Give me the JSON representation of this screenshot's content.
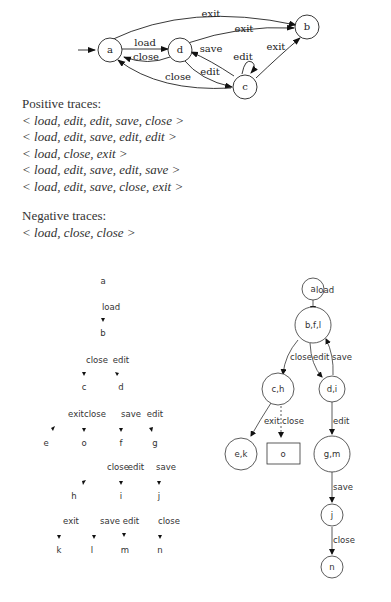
{
  "top_fsm": {
    "states": [
      "a",
      "d",
      "c",
      "b"
    ],
    "initial": "a",
    "edges": [
      {
        "from": "a",
        "to": "d",
        "label": "load"
      },
      {
        "from": "d",
        "to": "a",
        "label": "close"
      },
      {
        "from": "a",
        "to": "b",
        "label": "exit"
      },
      {
        "from": "d",
        "to": "b",
        "label": "exit"
      },
      {
        "from": "d",
        "to": "c",
        "label": "edit"
      },
      {
        "from": "c",
        "to": "d",
        "label": "save"
      },
      {
        "from": "c",
        "to": "c",
        "label": "edit"
      },
      {
        "from": "c",
        "to": "a",
        "label": "close"
      },
      {
        "from": "c",
        "to": "b",
        "label": "exit"
      }
    ]
  },
  "positive": {
    "title": "Positive traces:",
    "traces": [
      "< load, edit, edit, save, close >",
      "< load, edit, save, edit, edit >",
      "< load, close, exit >",
      "< load, edit, save, edit, save >",
      "< load, edit, save, close, exit >"
    ]
  },
  "negative": {
    "title": "Negative traces:",
    "traces": [
      "< load, close, close >"
    ]
  },
  "prefix_tree": {
    "nodes": [
      "a",
      "b",
      "c",
      "d",
      "e",
      "o",
      "f",
      "g",
      "h",
      "i",
      "j",
      "k",
      "l",
      "m",
      "n"
    ],
    "edge_labels": {
      "ab": "load",
      "bc": "close",
      "bd": "edit",
      "ce": "exit",
      "co": "close",
      "df": "save",
      "dg": "edit",
      "fh": "close",
      "fi": "edit",
      "gj": "save",
      "hk": "exit",
      "il": "save",
      "im": "edit",
      "jn": "close"
    }
  },
  "merged_fsm": {
    "nodes": {
      "a": "a",
      "bfl": "b,f,l",
      "ch": "c,h",
      "di": "d,i",
      "ek": "e,k",
      "o": "o",
      "gm": "g,m",
      "j": "j",
      "n": "n"
    },
    "edge_labels": {
      "a_bfl": "load",
      "bfl_ch": "close",
      "bfl_di": "edit",
      "di_bfl": "save",
      "ch_ek": "exit",
      "ch_o": "close",
      "di_gm": "edit",
      "gm_j": "save",
      "j_n": "close"
    }
  }
}
